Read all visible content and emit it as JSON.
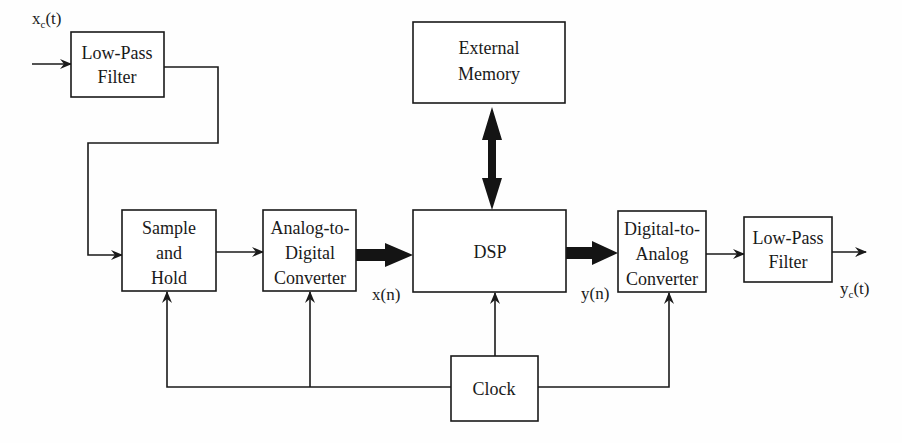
{
  "blocks": {
    "lpf_in": {
      "lines": [
        "Low-Pass",
        "Filter"
      ]
    },
    "sample_hold": {
      "lines": [
        "Sample",
        "and",
        "Hold"
      ]
    },
    "adc": {
      "lines": [
        "Analog-to-",
        "Digital",
        "Converter"
      ]
    },
    "dsp": {
      "lines": [
        "DSP"
      ]
    },
    "ext_memory": {
      "lines": [
        "External",
        "Memory"
      ]
    },
    "dac": {
      "lines": [
        "Digital-to-",
        "Analog",
        "Converter"
      ]
    },
    "lpf_out": {
      "lines": [
        "Low-Pass",
        "Filter"
      ]
    },
    "clock": {
      "lines": [
        "Clock"
      ]
    }
  },
  "signals": {
    "input": {
      "base": "x",
      "subscript": "c",
      "arg": "(t)"
    },
    "output": {
      "base": "y",
      "subscript": "c",
      "arg": "(t)"
    },
    "adc_out": {
      "text": "x(n)"
    },
    "dsp_out": {
      "text": "y(n)"
    }
  }
}
